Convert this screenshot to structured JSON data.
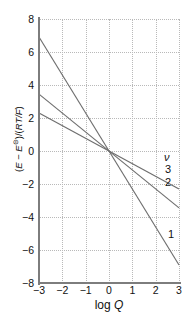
{
  "chart_data": {
    "type": "line",
    "title": "",
    "xlabel": "log Q",
    "ylabel": "(E − E⊝)/(RT/F)",
    "xlim": [
      -3,
      3
    ],
    "ylim": [
      -8,
      8
    ],
    "xticks": [
      "−3",
      "−2",
      "−1",
      "0",
      "1",
      "2",
      "3"
    ],
    "xtick_values": [
      -3,
      -2,
      -1,
      0,
      1,
      2,
      3
    ],
    "yticks": [
      "8",
      "6",
      "4",
      "2",
      "0",
      "−2",
      "−4",
      "−6",
      "−8"
    ],
    "ytick_values": [
      8,
      6,
      4,
      2,
      0,
      -2,
      -4,
      -6,
      -8
    ],
    "grid": true,
    "legend_position": "inline-right",
    "legend_title": "ν",
    "series": [
      {
        "name": "1",
        "label": "1",
        "slope": -2.303,
        "intercept": 0,
        "x": [
          -3,
          3
        ],
        "values": [
          6.91,
          -6.91
        ],
        "color": "#6e6e6e"
      },
      {
        "name": "2",
        "label": "2",
        "slope": -1.151,
        "intercept": 0,
        "x": [
          -3,
          3
        ],
        "values": [
          3.45,
          -3.45
        ],
        "color": "#6e6e6e"
      },
      {
        "name": "3",
        "label": "3",
        "slope": -0.768,
        "intercept": 0,
        "x": [
          -3,
          3
        ],
        "values": [
          2.3,
          -2.3
        ],
        "color": "#6e6e6e"
      }
    ],
    "annotations": [
      {
        "id": "nu",
        "text": "ν"
      },
      {
        "id": "s3",
        "text": "3"
      },
      {
        "id": "s2",
        "text": "2"
      },
      {
        "id": "s1",
        "text": "1"
      }
    ]
  },
  "axes": {
    "y_title_parts": {
      "open": "(",
      "e1": "E",
      "minus": " − ",
      "e2": "E",
      "sup": "⊝",
      "close": ")/(",
      "rt": "RT/F",
      "end": ")"
    },
    "x_title_prefix": "log ",
    "x_title_var": "Q"
  },
  "colors": {
    "line": "#6e6e6e",
    "axis": "#7d7d7d",
    "grid": "#b9b9b9",
    "text": "#111111",
    "background": "#ffffff"
  }
}
